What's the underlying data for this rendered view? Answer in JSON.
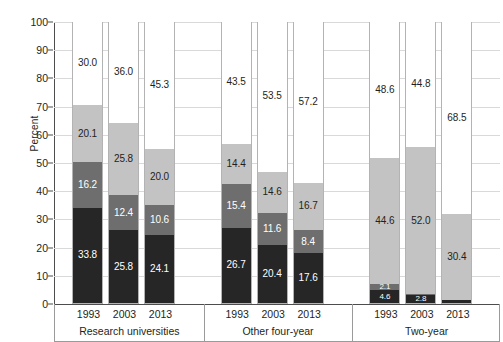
{
  "chart_data": {
    "type": "bar",
    "title": "",
    "subtitle": "",
    "xlabel": "",
    "ylabel": "Percent",
    "ylim": [
      0,
      100
    ],
    "yticks": [
      0,
      10,
      20,
      30,
      40,
      50,
      60,
      70,
      80,
      90,
      100
    ],
    "ytick_labels": [
      "0",
      "10",
      "20",
      "30",
      "40",
      "50",
      "60",
      "70",
      "80",
      "90",
      "100"
    ],
    "grid": true,
    "stacked": true,
    "legend": "none",
    "categories": [
      "1993",
      "2003",
      "2013"
    ],
    "groups": [
      {
        "name": "Research universities",
        "bars": [
          {
            "category": "1993",
            "segments": [
              {
                "series": "series-1",
                "value": 33.8,
                "label": "33.8",
                "color": "#262626"
              },
              {
                "series": "series-2",
                "value": 16.2,
                "label": "16.2",
                "color": "#6e6e6e"
              },
              {
                "series": "series-3",
                "value": 20.1,
                "label": "20.1",
                "color": "#c3c3c3"
              },
              {
                "series": "series-4",
                "value": 30.0,
                "label": "30.0",
                "color": "#ffffff"
              }
            ]
          },
          {
            "category": "2003",
            "segments": [
              {
                "series": "series-1",
                "value": 25.8,
                "label": "25.8",
                "color": "#262626"
              },
              {
                "series": "series-2",
                "value": 12.4,
                "label": "12.4",
                "color": "#6e6e6e"
              },
              {
                "series": "series-3",
                "value": 25.8,
                "label": "25.8",
                "color": "#c3c3c3"
              },
              {
                "series": "series-4",
                "value": 36.0,
                "label": "36.0",
                "color": "#ffffff"
              }
            ]
          },
          {
            "category": "2013",
            "segments": [
              {
                "series": "series-1",
                "value": 24.1,
                "label": "24.1",
                "color": "#262626"
              },
              {
                "series": "series-2",
                "value": 10.6,
                "label": "10.6",
                "color": "#6e6e6e"
              },
              {
                "series": "series-3",
                "value": 20.0,
                "label": "20.0",
                "color": "#c3c3c3"
              },
              {
                "series": "series-4",
                "value": 45.3,
                "label": "45.3",
                "color": "#ffffff"
              }
            ]
          }
        ]
      },
      {
        "name": "Other four-year",
        "bars": [
          {
            "category": "1993",
            "segments": [
              {
                "series": "series-1",
                "value": 26.7,
                "label": "26.7",
                "color": "#262626"
              },
              {
                "series": "series-2",
                "value": 15.4,
                "label": "15.4",
                "color": "#6e6e6e"
              },
              {
                "series": "series-3",
                "value": 14.4,
                "label": "14.4",
                "color": "#c3c3c3"
              },
              {
                "series": "series-4",
                "value": 43.5,
                "label": "43.5",
                "color": "#ffffff"
              }
            ]
          },
          {
            "category": "2003",
            "segments": [
              {
                "series": "series-1",
                "value": 20.4,
                "label": "20.4",
                "color": "#262626"
              },
              {
                "series": "series-2",
                "value": 11.6,
                "label": "11.6",
                "color": "#6e6e6e"
              },
              {
                "series": "series-3",
                "value": 14.6,
                "label": "14.6",
                "color": "#c3c3c3"
              },
              {
                "series": "series-4",
                "value": 53.5,
                "label": "53.5",
                "color": "#ffffff"
              }
            ]
          },
          {
            "category": "2013",
            "segments": [
              {
                "series": "series-1",
                "value": 17.6,
                "label": "17.6",
                "color": "#262626"
              },
              {
                "series": "series-2",
                "value": 8.4,
                "label": "8.4",
                "color": "#6e6e6e"
              },
              {
                "series": "series-3",
                "value": 16.7,
                "label": "16.7",
                "color": "#c3c3c3"
              },
              {
                "series": "series-4",
                "value": 57.2,
                "label": "57.2",
                "color": "#ffffff"
              }
            ]
          }
        ]
      },
      {
        "name": "Two-year",
        "bars": [
          {
            "category": "1993",
            "segments": [
              {
                "series": "series-1",
                "value": 4.6,
                "label": "4.6",
                "color": "#262626"
              },
              {
                "series": "series-2",
                "value": 2.1,
                "label": "2.1",
                "color": "#6e6e6e"
              },
              {
                "series": "series-3",
                "value": 44.6,
                "label": "44.6",
                "color": "#c3c3c3"
              },
              {
                "series": "series-4",
                "value": 48.6,
                "label": "48.6",
                "color": "#ffffff"
              }
            ]
          },
          {
            "category": "2003",
            "segments": [
              {
                "series": "series-1",
                "value": 2.8,
                "label": "2.8",
                "color": "#262626"
              },
              {
                "series": "series-2",
                "value": 0.4,
                "label": "",
                "color": "#6e6e6e"
              },
              {
                "series": "series-3",
                "value": 52.0,
                "label": "52.0",
                "color": "#c3c3c3"
              },
              {
                "series": "series-4",
                "value": 44.8,
                "label": "44.8",
                "color": "#ffffff"
              }
            ]
          },
          {
            "category": "2013",
            "segments": [
              {
                "series": "series-1",
                "value": 1.1,
                "label": "",
                "color": "#262626"
              },
              {
                "series": "series-2",
                "value": 0.0,
                "label": "",
                "color": "#6e6e6e"
              },
              {
                "series": "series-3",
                "value": 30.4,
                "label": "30.4",
                "color": "#c3c3c3"
              },
              {
                "series": "series-4",
                "value": 68.5,
                "label": "68.5",
                "color": "#ffffff"
              }
            ]
          }
        ]
      }
    ]
  }
}
